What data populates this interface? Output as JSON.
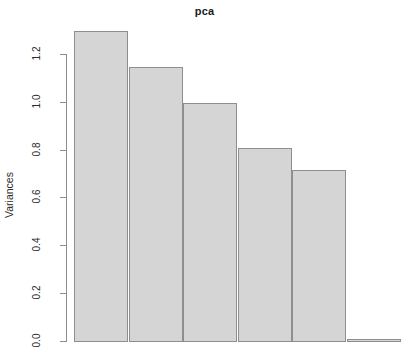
{
  "chart_data": {
    "type": "bar",
    "title": "pca",
    "xlabel": "",
    "ylabel": "Variances",
    "categories": [
      "1",
      "2",
      "3",
      "4",
      "5",
      "6"
    ],
    "values": [
      1.3,
      1.15,
      1.0,
      0.81,
      0.72,
      0.01
    ],
    "ylim": [
      0.0,
      1.3
    ],
    "y_ticks": [
      "1.2",
      "1.0",
      "0.8",
      "0.6",
      "0.4",
      "0.2",
      "0.0"
    ],
    "y_tick_values": [
      1.2,
      1.0,
      0.8,
      0.6,
      0.4,
      0.2,
      0.0
    ],
    "grid": false,
    "legend": false,
    "bar_fill_color": "#d5d5d5",
    "bar_border_color": "#8e8e8e",
    "axis_color": "#8c8c8c",
    "text_color": "#2b2b2b"
  }
}
